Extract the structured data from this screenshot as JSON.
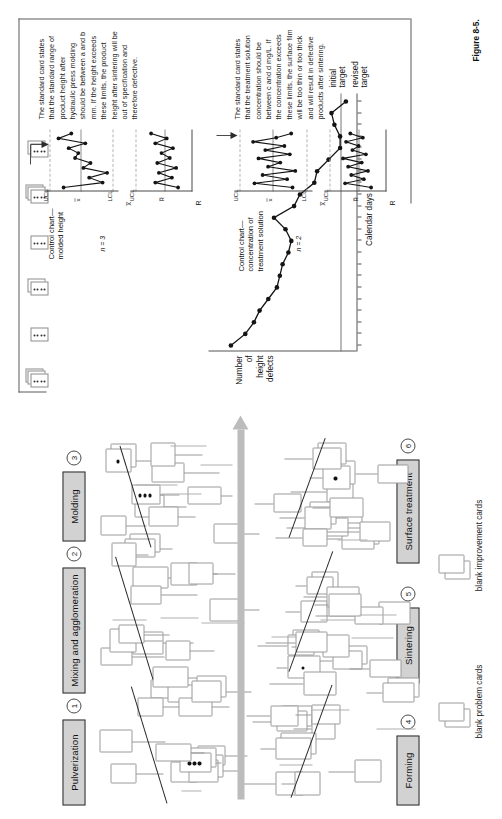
{
  "figure": {
    "caption": "Figure 8-5.",
    "orientation": "rotated-90-ccw"
  },
  "process_steps": [
    {
      "num": "1",
      "label": "Pulverization"
    },
    {
      "num": "2",
      "label": "Mixing and agglomeration"
    },
    {
      "num": "3",
      "label": "Molding"
    },
    {
      "num": "4",
      "label": "Forming"
    },
    {
      "num": "5",
      "label": "Sintering"
    },
    {
      "num": "6",
      "label": "Surface treatment"
    }
  ],
  "legend": {
    "problem_cards": "blank problem cards",
    "improvement_cards": "blank improvement cards"
  },
  "annotations": {
    "molded_height_note": "The standard card states that the standard range of product height after hydraulic press molding should be between a and b mm. If the height exceeds these limits, the product height after sintering will be out of specification and therefore defective.",
    "treatment_note": "The standard card states that the treatment solution concentration should be between c and d mg/L. If the concentration exceeds these limits, the surface film will be too thin or too thick and will result in defective products after sintering."
  },
  "control_charts": [
    {
      "title": "Control chart—\nmolded height",
      "n_label": "n = 3",
      "xbar_label": "x̅",
      "r_label": "R",
      "limits": {
        "ucl": "UCL",
        "center": "x̿",
        "lcl": "LCL",
        "r_ucl": "UCL",
        "r_center": "R̅"
      },
      "xbar_values": [
        0.78,
        0.17,
        0.38,
        0.1,
        0.47,
        0.36,
        0.6,
        0.55,
        0.7,
        0.44,
        0.86,
        0.66
      ],
      "r_values": [
        0.18,
        0.62,
        0.3,
        0.55,
        0.22,
        0.58,
        0.34,
        0.5,
        0.28,
        0.62,
        0.4,
        0.7
      ]
    },
    {
      "title": "Control chart—\nconcentration of\ntreatment solution",
      "n_label": "n = 2",
      "xbar_label": "x̅",
      "r_label": "R",
      "limits": {
        "ucl": "UCL",
        "center": "x̿",
        "lcl": "LCL",
        "r_ucl": "UCL",
        "r_center": "R̅"
      },
      "xbar_values": [
        0.22,
        0.78,
        0.3,
        0.66,
        0.18,
        0.58,
        0.4,
        0.72,
        0.26,
        0.62,
        0.34,
        0.8,
        0.46,
        0.24
      ],
      "r_values": [
        0.2,
        0.7,
        0.34,
        0.58,
        0.26,
        0.64,
        0.38,
        0.74,
        0.3,
        0.56,
        0.44,
        0.68,
        0.36,
        0.6
      ]
    }
  ],
  "chart_data": {
    "type": "line",
    "title": "",
    "ylabel": "Number\nof\nheight\ndefects",
    "ylabel_lines": [
      "Number",
      "of",
      "height",
      "defects"
    ],
    "xlabel": "Calendar days",
    "grid": false,
    "legend": "none",
    "annotations": [
      {
        "text": "initial\ntarget",
        "lines": [
          "initial",
          "target"
        ]
      },
      {
        "text": "revised\ntarget",
        "lines": [
          "revised",
          "target"
        ]
      }
    ],
    "x": [
      1,
      2,
      3,
      4,
      5,
      6,
      7,
      8,
      9,
      10,
      11,
      12,
      13,
      14,
      15,
      16,
      17,
      18,
      19,
      20,
      21,
      22
    ],
    "values": [
      43,
      38,
      35,
      33,
      30,
      27,
      26,
      25,
      23,
      22,
      24,
      28,
      21,
      19,
      14,
      13,
      9,
      5,
      5,
      7,
      8,
      3
    ],
    "ylim": [
      0,
      48
    ],
    "targets": {
      "initial": 5,
      "revised": 0
    }
  },
  "card_stacks": [
    {
      "count": 3,
      "dots": 4
    },
    {
      "count": 1,
      "dots": 4
    },
    {
      "count": 2,
      "dots": 4
    },
    {
      "count": 1,
      "dots": 4
    },
    {
      "count": 3,
      "dots": 4
    },
    {
      "count": 2,
      "dots": 4
    }
  ]
}
